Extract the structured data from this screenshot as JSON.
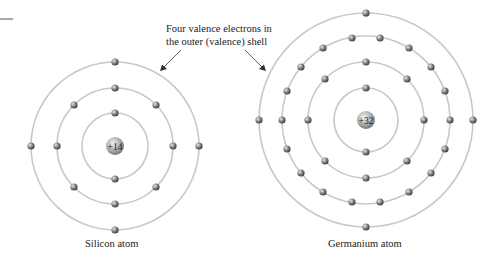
{
  "callout": {
    "line1": "Four valence electrons in",
    "line2": "the outer (valence) shell"
  },
  "silicon": {
    "label": "Silicon atom",
    "nucleus": "+14",
    "center": [
      115,
      146
    ],
    "shells": [
      {
        "r": 33,
        "electrons": 2
      },
      {
        "r": 58,
        "electrons": 8
      },
      {
        "r": 84,
        "electrons": 4
      }
    ]
  },
  "germanium": {
    "label": "Germanium atom",
    "nucleus": "+32",
    "center": [
      366,
      120
    ],
    "shells": [
      {
        "r": 32,
        "electrons": 2
      },
      {
        "r": 58,
        "electrons": 8
      },
      {
        "r": 84,
        "electrons": 18
      },
      {
        "r": 107,
        "electrons": 4
      }
    ]
  },
  "colors": {
    "shell": "#c8c8c8",
    "electron": "#6a6a6a",
    "text": "#222222"
  }
}
